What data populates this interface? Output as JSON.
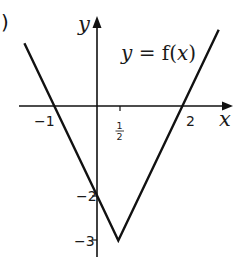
{
  "part_label": ")",
  "chart_data": {
    "type": "line",
    "title": "",
    "function_label": "y = f(x)",
    "function_label_parts": {
      "y": "y",
      "eq": " = f(",
      "x": "x",
      "close": ")"
    },
    "xlabel": "x",
    "ylabel": "y",
    "x_ticks": [
      {
        "value": -1,
        "label": "−1"
      },
      {
        "value": 0.5,
        "label_num": "1",
        "label_den": "2"
      },
      {
        "value": 2,
        "label": "2"
      }
    ],
    "y_ticks": [
      {
        "value": -2,
        "label": "−2"
      },
      {
        "value": -3,
        "label": "−3"
      }
    ],
    "series": [
      {
        "name": "y = f(x)",
        "x": [
          -1.7,
          -1,
          0,
          0.5,
          2,
          2.85
        ],
        "y": [
          1.4,
          0,
          -2,
          -3,
          0,
          1.7
        ]
      }
    ],
    "key_points": {
      "x_intercepts": [
        -1,
        2
      ],
      "y_intercept": -2,
      "vertex": [
        0.5,
        -3
      ]
    },
    "xlim": [
      -1.85,
      3.3
    ],
    "ylim": [
      -3.4,
      2.3
    ],
    "grid": false,
    "legend": "none",
    "line_color": "#111111"
  }
}
